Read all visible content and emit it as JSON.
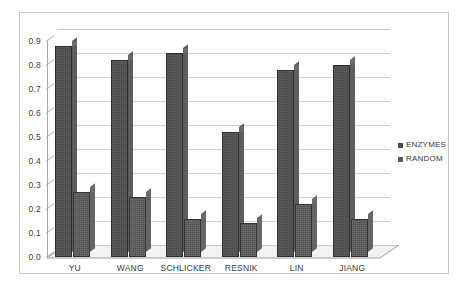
{
  "chart_data": {
    "type": "bar",
    "title": "",
    "xlabel": "",
    "ylabel": "",
    "categories": [
      "YU",
      "WANG",
      "SCHLICKER",
      "RESNIK",
      "LIN",
      "JIANG"
    ],
    "series": [
      {
        "name": "ENZYMES",
        "values": [
          0.88,
          0.82,
          0.85,
          0.52,
          0.78,
          0.8
        ],
        "color": "#4a4a4a"
      },
      {
        "name": "RANDOM",
        "values": [
          0.27,
          0.25,
          0.16,
          0.14,
          0.22,
          0.16
        ],
        "color": "#545454"
      }
    ],
    "ylim": [
      0.0,
      0.9
    ],
    "ytick_labels": [
      "0.9",
      "0.8",
      "0.7",
      "0.6",
      "0.5",
      "0.4",
      "0.3",
      "0.2",
      "0.1",
      "0.0"
    ],
    "ytick_values": [
      0.9,
      0.8,
      0.7,
      0.6,
      0.5,
      0.4,
      0.3,
      0.2,
      0.1,
      0.0
    ],
    "grid": true,
    "legend_position": "right",
    "style": "3d-column"
  },
  "legend": {
    "entries": [
      {
        "label": "ENZYMES",
        "marker": "square-swatch-icon"
      },
      {
        "label": "RANDOM",
        "marker": "square-swatch-icon"
      }
    ]
  }
}
